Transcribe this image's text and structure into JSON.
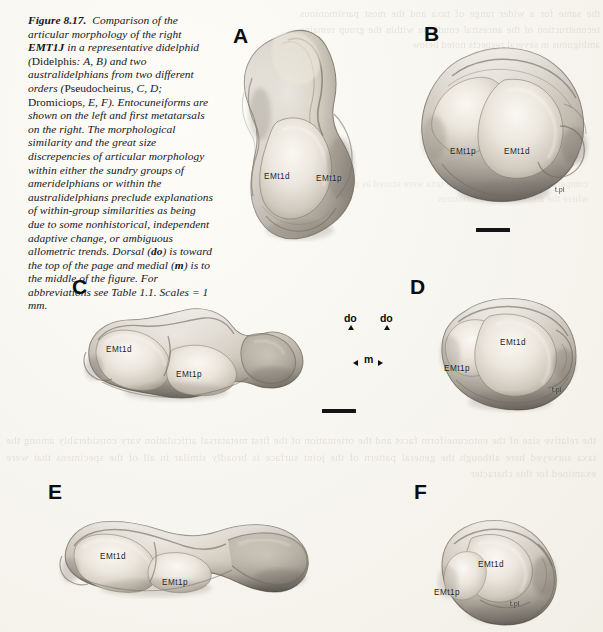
{
  "figure": {
    "number": "Figure 8.17.",
    "caption_runs": [
      {
        "text": "Figure 8.17.",
        "style": "bold-italic"
      },
      {
        "text": "  Comparison of the articular morphology of the right ",
        "style": "italic"
      },
      {
        "text": "EMT1J",
        "style": "bold-italic"
      },
      {
        "text": " in a representative didelphid (",
        "style": "italic"
      },
      {
        "text": "Didelphis",
        "style": "roman"
      },
      {
        "text": ": A, B) and two australidelphians from two different orders (",
        "style": "italic"
      },
      {
        "text": "Pseudocheirus",
        "style": "roman"
      },
      {
        "text": ", C, D; ",
        "style": "italic"
      },
      {
        "text": "Dromiciops",
        "style": "roman"
      },
      {
        "text": ", E, F). Entocuneiforms are shown on the left and first metatarsals on the right. The morphological similarity and the great size discrepencies of articular morphology within either the sundry groups of ameridelphians or within the australidelphians preclude explanations of within-group similarities as being due to some nonhistorical, independent adaptive change, or ambiguous allometric trends. Dorsal (",
        "style": "italic"
      },
      {
        "text": "do",
        "style": "bold-italic"
      },
      {
        "text": ") is toward the top of the page and medial (",
        "style": "italic"
      },
      {
        "text": "m",
        "style": "bold-italic"
      },
      {
        "text": ") is to the middle of the figure. For abbreviations see Table 1.1. Scales = 1 mm.",
        "style": "italic"
      }
    ],
    "caption_plain": "Figure 8.17. Comparison of the articular morphology of the right EMT1J in a representative didelphid (Didelphis: A, B) and two australidelphians from two different orders (Pseudocheirus, C, D; Dromiciops, E, F). Entocuneiforms are shown on the left and first metatarsals on the right. The morphological similarity and the great size discrepencies of articular morphology within either the sundry groups of ameridelphians or within the australidelphians preclude explanations of within-group similarities as being due to some nonhistorical, independent adaptive change, or ambiguous allometric trends. Dorsal (do) is toward the top of the page and medial (m) is to the middle of the figure. For abbreviations see Table 1.1. Scales = 1 mm."
  },
  "panels": {
    "a": {
      "letter": "A",
      "specimen": "Didelphis entocuneiform",
      "labels": [
        {
          "id": "emt1d",
          "text": "EMt1d"
        },
        {
          "id": "emt1p",
          "text": "EMt1p"
        }
      ]
    },
    "b": {
      "letter": "B",
      "specimen": "Didelphis first metatarsal",
      "labels": [
        {
          "id": "emt1p",
          "text": "EMt1p"
        },
        {
          "id": "emt1d",
          "text": "EMt1d"
        },
        {
          "id": "tpl",
          "text": "t.pl"
        }
      ]
    },
    "c": {
      "letter": "C",
      "specimen": "Pseudocheirus entocuneiform",
      "labels": [
        {
          "id": "emt1d",
          "text": "EMt1d"
        },
        {
          "id": "emt1p",
          "text": "EMt1p"
        }
      ]
    },
    "d": {
      "letter": "D",
      "specimen": "Pseudocheirus first metatarsal",
      "labels": [
        {
          "id": "emt1d",
          "text": "EMt1d"
        },
        {
          "id": "emt1p",
          "text": "EMt1p"
        },
        {
          "id": "tpl",
          "text": "t.pl"
        }
      ]
    },
    "e": {
      "letter": "E",
      "specimen": "Dromiciops entocuneiform",
      "labels": [
        {
          "id": "emt1d",
          "text": "EMt1d"
        },
        {
          "id": "emt1p",
          "text": "EMt1p"
        }
      ]
    },
    "f": {
      "letter": "F",
      "specimen": "Dromiciops first metatarsal",
      "labels": [
        {
          "id": "emt1d",
          "text": "EMt1d"
        },
        {
          "id": "emt1p",
          "text": "EMt1p"
        },
        {
          "id": "tpl",
          "text": "t.pl"
        }
      ]
    }
  },
  "orientation_key": {
    "dorsal_left": "do",
    "dorsal_right": "do",
    "medial": "m"
  },
  "scale_bars": {
    "upper_caption": "1 mm",
    "lower_caption": "1 mm"
  },
  "bleed_through": {
    "right": "the same for a wider range of taxa and the most parsimonious reconstruction of the ancestral condition within the group remains ambiguous in several respects noted below",
    "middle": "comparable states in the outgroup taxa were scored as present where the articulation is continuous",
    "bottom": "the relative size of the entocuneiform facet and the orientation of the first metatarsal articulation vary considerably among the taxa surveyed here although the general pattern of the joint surface is broadly similar in all of the specimens that were examined for this character"
  },
  "colors": {
    "paper": "#fbfaf6",
    "ink": "#16161a",
    "bone_light": "#efeae2",
    "bone_mid": "#c9c2b8",
    "bone_dark": "#8d877e",
    "bone_shadow": "#6d6860"
  }
}
